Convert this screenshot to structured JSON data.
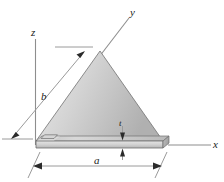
{
  "figure": {
    "background_color": "#ffffff",
    "axes": [
      {
        "name": "x",
        "label": "x"
      },
      {
        "name": "y",
        "label": "y"
      },
      {
        "name": "z",
        "label": "z"
      }
    ],
    "dimensions": [
      {
        "name": "a",
        "label": "a",
        "description": "base width of triangle"
      },
      {
        "name": "b",
        "label": "b",
        "description": "slant side length of triangle"
      },
      {
        "name": "t",
        "label": "t",
        "description": "thickness of plate"
      }
    ],
    "colors": {
      "plate_light": "#e9e9e9",
      "plate_mid": "#c9c9c9",
      "plate_dark": "#a8a8a8",
      "edge": "#6d6d6d",
      "axis": "#8e8e8e",
      "text": "#1a1a1a"
    }
  }
}
